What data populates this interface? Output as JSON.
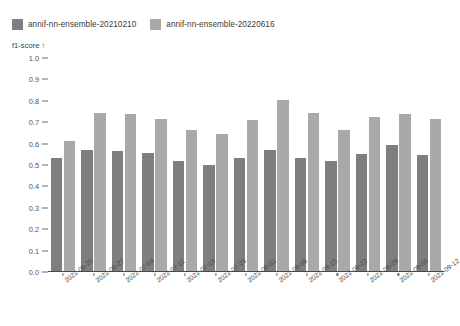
{
  "chart_data": {
    "type": "bar",
    "title": "",
    "subtitle": "",
    "xlabel": "",
    "ylabel": "f1-score ↑",
    "ylim": [
      0.0,
      1.0
    ],
    "ytick_labels": [
      "1.0",
      "0.9",
      "0.8",
      "0.7",
      "0.6",
      "0.5",
      "0.4",
      "0.3",
      "0.2",
      "0.1",
      "0.0"
    ],
    "ytick_values": [
      1.0,
      0.9,
      0.8,
      0.7,
      0.6,
      0.5,
      0.4,
      0.3,
      0.2,
      0.1,
      0.0
    ],
    "grid": false,
    "legend_position": "top-left",
    "categories": [
      "2022-06-20",
      "2022-06-27",
      "2022-07-04",
      "2022-07-11",
      "2022-07-18",
      "2022-07-25",
      "2022-08-01",
      "2022-08-08",
      "2022-08-15",
      "2022-08-22",
      "2022-08-29",
      "2022-09-05",
      "2022-09-12"
    ],
    "series": [
      {
        "name": "annif-nn-ensemble-20210210",
        "color": "#7e7e7e",
        "values": [
          0.535,
          0.57,
          0.565,
          0.555,
          0.52,
          0.5,
          0.535,
          0.57,
          0.535,
          0.52,
          0.55,
          0.595,
          0.545
        ]
      },
      {
        "name": "annif-nn-ensemble-20220616",
        "color": "#a9a9a9",
        "values": [
          0.61,
          0.745,
          0.74,
          0.715,
          0.665,
          0.645,
          0.71,
          0.805,
          0.745,
          0.665,
          0.725,
          0.74,
          0.715
        ]
      }
    ]
  },
  "legend": {
    "items": [
      {
        "label": "annif-nn-ensemble-20210210",
        "color": "#7e7e7e"
      },
      {
        "label": "annif-nn-ensemble-20220616",
        "color": "#a9a9a9"
      }
    ]
  },
  "axis": {
    "y_title": "f1-score ↑"
  }
}
